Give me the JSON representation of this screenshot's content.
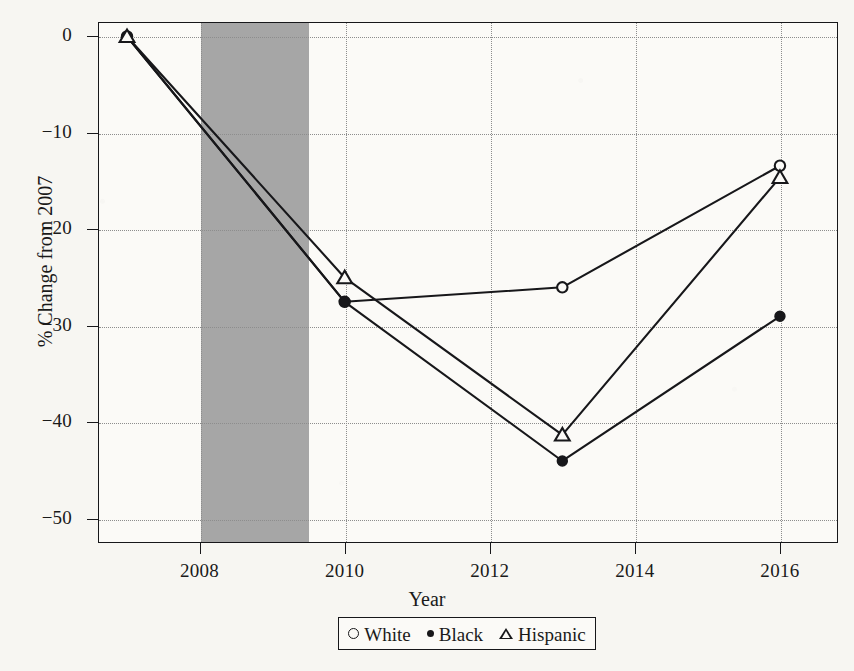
{
  "chart_data": {
    "type": "line",
    "title": "",
    "xlabel": "Year",
    "ylabel": "% Change from 2007",
    "x": [
      2007,
      2010,
      2013,
      2016
    ],
    "xlim": [
      2006.6,
      2016.8
    ],
    "ylim": [
      -52.5,
      1.5
    ],
    "grid": true,
    "legend_position": "bottom-center",
    "xticks": [
      2008,
      2010,
      2012,
      2014,
      2016
    ],
    "xtick_labels": [
      "2008",
      "2010",
      "2012",
      "2014",
      "2016"
    ],
    "yticks": [
      0,
      -10,
      -20,
      -30,
      -40,
      -50
    ],
    "ytick_labels": [
      "0",
      "−10",
      "−20",
      "−30",
      "−40",
      "−50"
    ],
    "shaded_region": {
      "label": "recession",
      "x_start": 2008.0,
      "x_end": 2009.5,
      "color": "#9e9e9e"
    },
    "series": [
      {
        "name": "White",
        "marker": "open-circle",
        "color": "#17171a",
        "values": [
          0,
          -27.5,
          -26.0,
          -13.4
        ]
      },
      {
        "name": "Black",
        "marker": "filled-circle",
        "color": "#17171a",
        "values": [
          0,
          -27.5,
          -44.0,
          -29.0
        ]
      },
      {
        "name": "Hispanic",
        "marker": "open-triangle",
        "color": "#17171a",
        "values": [
          0,
          -25.0,
          -41.3,
          -14.6
        ]
      }
    ]
  },
  "legend": {
    "items": [
      {
        "label": "White",
        "symbol": "open-circle"
      },
      {
        "label": "Black",
        "symbol": "filled-circle"
      },
      {
        "label": "Hispanic",
        "symbol": "open-triangle"
      }
    ]
  },
  "axes": {
    "x_title": "Year",
    "y_title": "% Change from 2007"
  }
}
